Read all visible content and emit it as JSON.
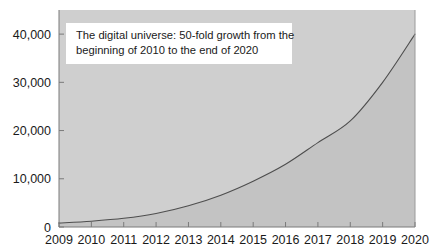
{
  "chart_data": {
    "type": "area",
    "title": "",
    "subtitle": "",
    "xlabel": "",
    "ylabel": "",
    "x": [
      2009,
      2010,
      2011,
      2012,
      2013,
      2014,
      2015,
      2016,
      2017,
      2018,
      2019,
      2020
    ],
    "categories": [
      "2009",
      "2010",
      "2011",
      "2012",
      "2013",
      "2014",
      "2015",
      "2016",
      "2017",
      "2018",
      "2019",
      "2020"
    ],
    "series": [
      {
        "name": "Digital universe size",
        "values": [
          800,
          1200,
          1800,
          2800,
          4400,
          6600,
          9500,
          13000,
          17500,
          22000,
          30000,
          40000
        ]
      }
    ],
    "values": [
      800,
      1200,
      1800,
      2800,
      4400,
      6600,
      9500,
      13000,
      17500,
      22000,
      30000,
      40000
    ],
    "ylim": [
      0,
      45000
    ],
    "xlim": [
      2009,
      2020
    ],
    "yticks": [
      0,
      10000,
      20000,
      30000,
      40000
    ],
    "ytick_labels": [
      "0",
      "10,000",
      "20,000",
      "30,000",
      "40,000"
    ],
    "xticks": [
      2009,
      2010,
      2011,
      2012,
      2013,
      2014,
      2015,
      2016,
      2017,
      2018,
      2019,
      2020
    ],
    "xtick_labels": [
      "2009",
      "2010",
      "2011",
      "2012",
      "2013",
      "2014",
      "2015",
      "2016",
      "2017",
      "2018",
      "2019",
      "2020"
    ],
    "grid": false,
    "legend": false,
    "legend_position": "none",
    "annotations": [
      {
        "lines": [
          "The digital universe: 50-fold growth from the",
          "beginning of 2010 to the end of 2020"
        ],
        "box_fill": "#ffffff",
        "text_color": "#1a1a1a"
      }
    ],
    "colors": {
      "plot_background": "#cfcfcf",
      "area_fill": "#c4c4c4",
      "line": "#4a4a4a",
      "axis": "#707070",
      "tick_label": "#1a1a1a",
      "figure_background": "#ffffff"
    }
  }
}
